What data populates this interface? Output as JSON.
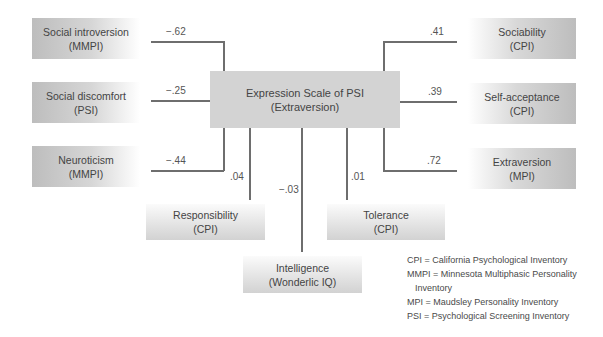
{
  "center": {
    "line1": "Expression Scale of PSI",
    "line2": "(Extraversion)"
  },
  "left": [
    {
      "name": "Social introversion",
      "source": "(MMPI)",
      "coef": "−.62"
    },
    {
      "name": "Social discomfort",
      "source": "(PSI)",
      "coef": "−.25"
    },
    {
      "name": "Neuroticism",
      "source": "(MMPI)",
      "coef": "−.44"
    }
  ],
  "right": [
    {
      "name": "Sociability",
      "source": "(CPI)",
      "coef": ".41"
    },
    {
      "name": "Self-acceptance",
      "source": "(CPI)",
      "coef": ".39"
    },
    {
      "name": "Extraversion",
      "source": "(MPI)",
      "coef": ".72"
    }
  ],
  "bottom": [
    {
      "name": "Responsibility",
      "source": "(CPI)",
      "coef": ".04"
    },
    {
      "name": "Intelligence",
      "source": "(Wonderlic IQ)",
      "coef": "−.03"
    },
    {
      "name": "Tolerance",
      "source": "(CPI)",
      "coef": ".01"
    }
  ],
  "legend": [
    "CPI = California Psychological Inventory",
    "MMPI = Minnesota Multiphasic Personality",
    "Inventory",
    "MPI = Maudsley Personality Inventory",
    "PSI = Psychological Screening Inventory"
  ]
}
